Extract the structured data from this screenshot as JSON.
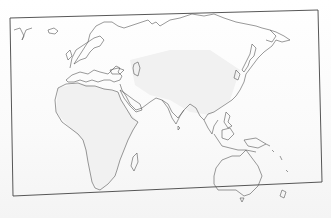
{
  "map": {
    "type": "blank-outline-map",
    "region": "Eastern Hemisphere",
    "regions_shown": [
      "Europe",
      "Africa",
      "Asia",
      "Middle East",
      "Australia",
      "Oceania"
    ],
    "labels": [],
    "colors": {
      "paper": "#ffffff",
      "outline": "#555555",
      "frame": "#444444",
      "land_shade": "#f1f1f1"
    }
  }
}
